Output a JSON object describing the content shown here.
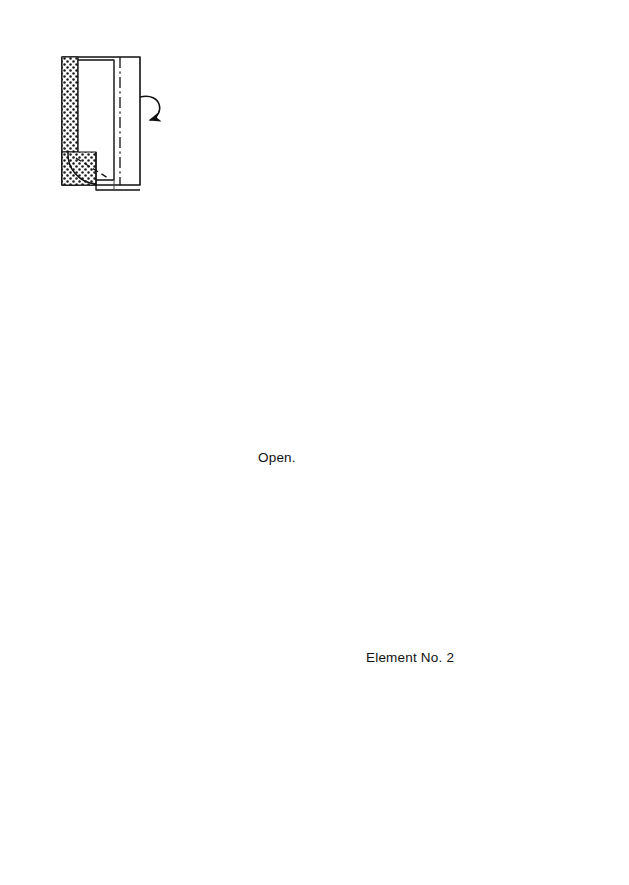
{
  "page": {
    "background": "#ffffff",
    "ink": "#000000",
    "width": 629,
    "height": 885
  },
  "labels": {
    "open": "Open.",
    "element": "Element No. 2"
  },
  "steps": [
    {
      "id": "step-5",
      "number": "5",
      "glyph": "⑤",
      "x": 83,
      "y": 42,
      "note": "rectangle, dotted left band, dash-dot vertical crease, curl-over arrow to right"
    },
    {
      "id": "step-6",
      "number": "6",
      "glyph": "⑥",
      "x": 237,
      "y": 40,
      "note": "rectangle, dotted left band, diagonal flap bottom, curl-over arrow to left"
    },
    {
      "id": "step-7",
      "number": "7",
      "glyph": "⑦",
      "x": 345,
      "y": 43,
      "note": "open tube, hollow triangle marker left, dashed horizontal valley fold, pleat arrows"
    },
    {
      "id": "step-8",
      "number": "8",
      "glyph": "⑧",
      "x": 483,
      "y": 43,
      "note": "tube with lower band, diagonal crease, dashed valley fold, fold-down arrow"
    },
    {
      "id": "step-9",
      "number": "9",
      "glyph": "⑨",
      "x": 537,
      "y": 309,
      "note": "circled close-up: squash-fold creases with dot markers and two pull arrows"
    },
    {
      "id": "step-10",
      "number": "10",
      "glyph": "⑩",
      "x": 320,
      "y": 325,
      "note": "circled close-up: open the model, outward arrows left and right"
    },
    {
      "id": "step-11",
      "number": "11",
      "glyph": "⑪",
      "x": 51,
      "y": 434,
      "note": "flattened square, vertical pleat lines, mountain dashes, two curved fold arrows"
    },
    {
      "id": "step-12",
      "number": "12",
      "glyph": "⑫",
      "x": 42,
      "y": 626,
      "note": "vase shape, dotted flaps, dashed mountain Vs, multiple fold arrows"
    },
    {
      "id": "step-13",
      "number": "13",
      "glyph": "⑬",
      "x": 196,
      "y": 722,
      "note": "wide form, dashed horizontal valley, fold-down arrow, dotted wings"
    },
    {
      "id": "step-14",
      "number": "14",
      "glyph": "⑭",
      "x": 374,
      "y": 744,
      "note": "fully dotted form, short fold arrows inside band"
    },
    {
      "id": "step-15",
      "number": "15",
      "glyph": "⑮",
      "x": 463,
      "y": 597,
      "note": "finished trapezoid, fully dotted, labelled Element No. 2"
    }
  ],
  "flow_arrows": [
    {
      "id": "arrow-8-to-9",
      "kind": "curved-down",
      "from": "step-8",
      "to": "step-9",
      "note": "large hollow curved arrow descending right side"
    },
    {
      "id": "arrow-14-to-15",
      "kind": "curved-up",
      "from": "step-14",
      "to": "step-15",
      "note": "curved arrow with turn-over loop circle"
    },
    {
      "id": "arrow-15-out",
      "kind": "elbow-right",
      "from": "step-15",
      "to": "next",
      "note": "L-shaped arrow going up then right"
    }
  ],
  "legend": {
    "valley_fold": "dashed line",
    "mountain_fold": "dash-dot line",
    "shaded_side": "dotted texture",
    "marker_dot": "solid dot",
    "hollow_triangle": "push/insert marker"
  },
  "colors": {
    "line": "#111111",
    "thin_line": "#666666",
    "paper": "#ffffff",
    "dot_texture": "#1a1a1a"
  }
}
